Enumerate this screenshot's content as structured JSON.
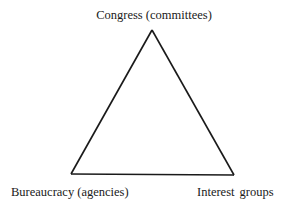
{
  "diagram": {
    "type": "triangle",
    "nodes": [
      {
        "id": "congress",
        "label": "Congress (committees)",
        "position": "top"
      },
      {
        "id": "bureaucracy",
        "label": "Bureaucracy (agencies)",
        "position": "bottom-left"
      },
      {
        "id": "interest_groups",
        "label": "Interest groups",
        "position": "bottom-right"
      }
    ],
    "edges": [
      {
        "from": "congress",
        "to": "bureaucracy"
      },
      {
        "from": "bureaucracy",
        "to": "interest_groups"
      },
      {
        "from": "interest_groups",
        "to": "congress"
      }
    ],
    "stroke_color": "#1a1a1a",
    "background_color": "#ffffff"
  }
}
